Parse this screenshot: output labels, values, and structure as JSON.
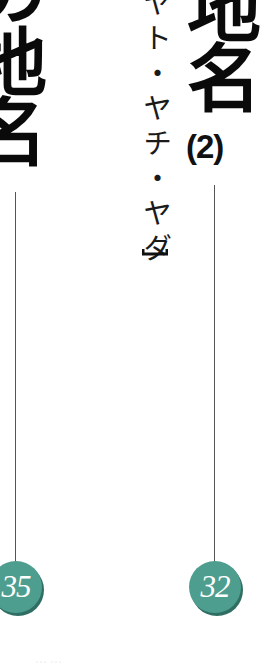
{
  "left_column": {
    "title": "の地名",
    "page_number": "35"
  },
  "right_column": {
    "title": "地名",
    "part": "(2)",
    "subtitle": "ヤト・ヤチ・ヤダ",
    "page_number": "32"
  },
  "footer_faint_text": "……",
  "colors": {
    "badge": "#4e9e8f",
    "badge_shadow": "#2f6e63",
    "rule": "#555555",
    "title": "#0a0a0a"
  }
}
